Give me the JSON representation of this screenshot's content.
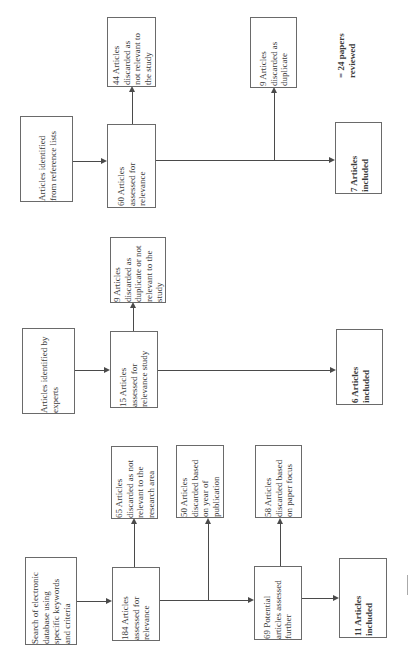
{
  "diagram": {
    "orientation": "rotated-90-ccw",
    "rows": [
      {
        "source": "Articles identified\nfrom reference lists",
        "assessed": "60 Articles\nassessed for\nrelevance",
        "discard_1": "44 Articles\ndiscarded as\nnot relevant to\nthe study",
        "discard_2": "9 Articles\ndiscarded as\nduplicate",
        "included": "7 Articles\nincluded",
        "note": "= 24 papers\nreviewed"
      },
      {
        "source": "Articles identified by\nexperts",
        "assessed": "15 Articles\nassessed for\nrelevance  study",
        "discard_1": "9 Articles\ndiscarded as\nduplicate or not\nrelevant to the\nstudy",
        "included": "6 Articles\nincluded"
      },
      {
        "source": "Search of electronic\ndatabase using\nspecific keywords\nand criteria",
        "assessed": "184 Articles\nassessed for\nrelevance",
        "discard_1": "65 Articles\ndiscarded as not\nrelevant to the\nresearch area",
        "discard_2": "50 Articles\ndiscarded based\non year of\npublication",
        "further": "69 Potential\narticles assessed\nfurther",
        "discard_3": "58 Articles\ndiscarded based\non paper focus",
        "included": "11 Articles\nincluded"
      }
    ]
  },
  "colors": {
    "border": "#6a6a6a",
    "line": "#4a4a4a",
    "text": "#3a3a3a"
  }
}
